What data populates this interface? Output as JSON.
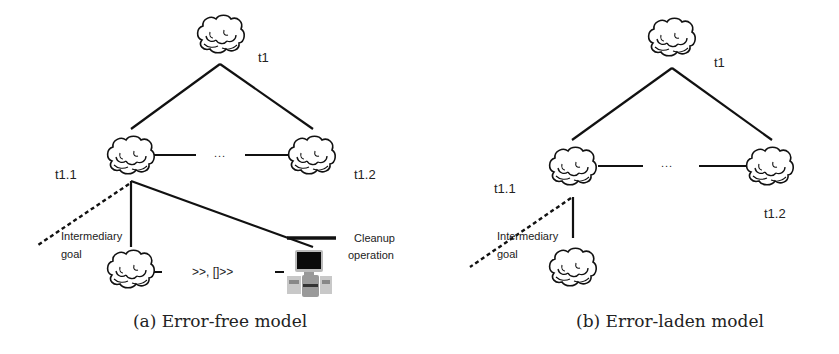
{
  "panels": [
    {
      "id": "a",
      "caption": "(a) Error-free model",
      "nodes": {
        "root": "t1",
        "left_child": "t1.1",
        "right_child": "t1.2"
      },
      "ellipsis": "...",
      "intermediary_label_line1": "Intermediary",
      "intermediary_label_line2": "goal",
      "sequence_operator": ">>, []>>",
      "cleanup_label_line1": "Cleanup",
      "cleanup_label_line2": "operation"
    },
    {
      "id": "b",
      "caption": "(b) Error-laden model",
      "nodes": {
        "root": "t1",
        "left_child": "t1.1",
        "right_child": "t1.2"
      },
      "ellipsis": "...",
      "intermediary_label_line1": "Intermediary",
      "intermediary_label_line2": "goal"
    }
  ],
  "icons": {
    "task_node": "cloud-icon",
    "cleanup_operation": "computer-icon"
  },
  "colors": {
    "line": "#111111",
    "text": "#222222",
    "background": "#ffffff"
  }
}
